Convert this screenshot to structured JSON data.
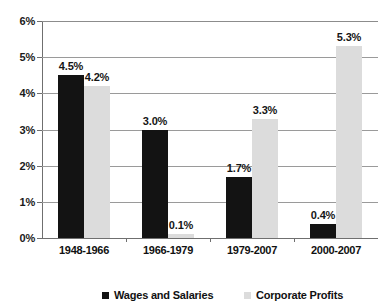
{
  "chart_data": {
    "type": "bar",
    "title": "",
    "subtitle": "",
    "xlabel": "",
    "ylabel": "",
    "categories": [
      "1948-1966",
      "1966-1979",
      "1979-2007",
      "2000-2007"
    ],
    "series": [
      {
        "name": "Wages and Salaries",
        "color": "#131313",
        "values": [
          4.5,
          3.0,
          1.7,
          0.4
        ],
        "labels": [
          "4.5%",
          "3.0%",
          "1.7%",
          "0.4%"
        ]
      },
      {
        "name": "Corporate Profits",
        "color": "#dcdcdc",
        "values": [
          4.2,
          0.1,
          3.3,
          5.3
        ],
        "labels": [
          "4.2%",
          "0.1%",
          "3.3%",
          "5.3%"
        ]
      }
    ],
    "ylim": [
      0,
      6
    ],
    "ytick_values": [
      0,
      1,
      2,
      3,
      4,
      5,
      6
    ],
    "ytick_labels": [
      "0%",
      "1%",
      "2%",
      "3%",
      "4%",
      "5%",
      "6%"
    ],
    "grid": true,
    "grid_axis": "y",
    "legend_position": "bottom",
    "value_labels_shown": true
  },
  "legend": {
    "items": [
      {
        "label": "Wages and Salaries",
        "marker": "square-marker-black"
      },
      {
        "label": "Corporate Profits",
        "marker": "square-marker-gray"
      }
    ]
  }
}
